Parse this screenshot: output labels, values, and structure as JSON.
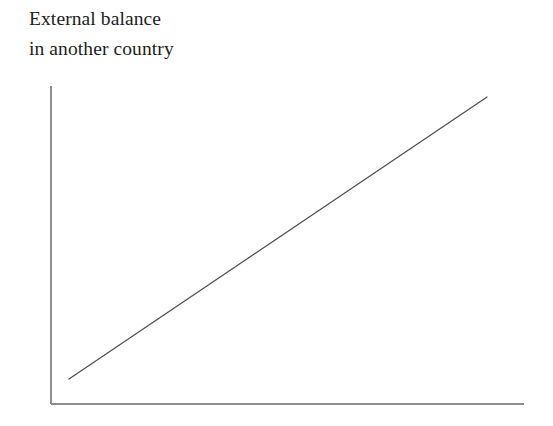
{
  "figure": {
    "caption": {
      "line1": "External balance",
      "line2": "in another country"
    },
    "caption_color": "#1d1d1d",
    "background_color": "#ffffff"
  },
  "chart_data": {
    "type": "line",
    "title": "External balance in another country",
    "xlabel": "",
    "ylabel": "",
    "xlim": [
      0,
      100
    ],
    "ylim": [
      0,
      100
    ],
    "grid": false,
    "legend": null,
    "axis_color": "#8e8e8e",
    "line_color": "#4f4f4f",
    "tick_labels": {
      "x": [],
      "y": []
    },
    "series": [
      {
        "name": "External balance schedule",
        "x": [
          3.8,
          92.2
        ],
        "y": [
          7.9,
          96.5
        ],
        "style": "solid",
        "annotation": "upward sloping straight line"
      }
    ],
    "axes_pixels": {
      "y_axis_x": 51,
      "y_axis_top": 86,
      "y_axis_bottom": 404,
      "x_axis_y": 404,
      "x_axis_left": 51,
      "x_axis_right": 524
    },
    "line_pixels": {
      "x1": 69,
      "y1": 379,
      "x2": 487,
      "y2": 97
    }
  }
}
